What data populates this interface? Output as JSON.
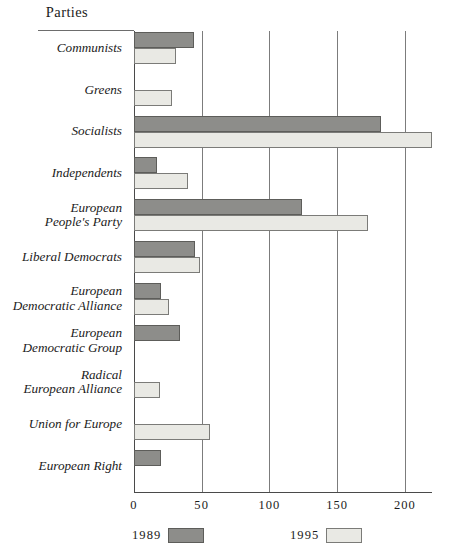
{
  "chart_data": {
    "type": "bar",
    "orientation": "horizontal",
    "title": "",
    "xlabel": "",
    "ylabel": "Parties",
    "axis_header": "Parties",
    "xlim": [
      0,
      220
    ],
    "xticks": [
      0,
      50,
      100,
      150,
      200
    ],
    "xtick_labels": [
      "0",
      "50",
      "100",
      "150",
      "200"
    ],
    "grid": true,
    "grid_axis": "x",
    "legend_position": "bottom",
    "categories": [
      "Communists",
      "Greens",
      "Socialists",
      "Independents",
      "European\nPeople's Party",
      "Liberal Democrats",
      "European\nDemocratic Alliance",
      "European\nDemocratic Group",
      "Radical\nEuropean Alliance",
      "Union for Europe",
      "European Right"
    ],
    "series": [
      {
        "name": "1989",
        "color": "#8d8d8a",
        "values": [
          44,
          0,
          182,
          17,
          124,
          45,
          20,
          34,
          0,
          0,
          20
        ]
      },
      {
        "name": "1995",
        "color": "#e9e9e4",
        "values": [
          31,
          28,
          220,
          40,
          173,
          49,
          26,
          0,
          19,
          56,
          0
        ]
      }
    ]
  },
  "legend": [
    {
      "label": "1989",
      "swatch": "y1989"
    },
    {
      "label": "1995",
      "swatch": "y1995"
    }
  ]
}
